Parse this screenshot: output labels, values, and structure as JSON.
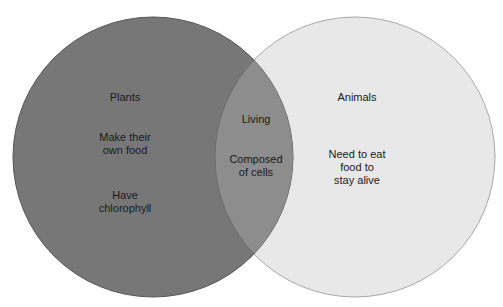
{
  "diagram": {
    "type": "venn",
    "colors": {
      "left_fill": "#777777",
      "left_stroke": "#555555",
      "right_fill": "#e8e8e8",
      "right_stroke": "#a8a8a8",
      "overlap_fill": "#8d8d8d",
      "text": "#1a1a1a"
    },
    "sets": [
      {
        "id": "plants",
        "title": "Plants",
        "items": [
          "Make their\nown food",
          "Have\nchlorophyll"
        ]
      },
      {
        "id": "animals",
        "title": "Animals",
        "items": [
          "Need to eat\nfood to\nstay alive"
        ]
      }
    ],
    "overlap": {
      "items": [
        "Living",
        "Composed\nof cells"
      ]
    }
  }
}
